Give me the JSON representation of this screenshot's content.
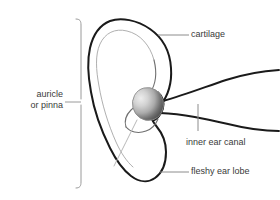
{
  "diagram": {
    "background_color": "#ffffff",
    "line_color": "#1a1a1a",
    "inner_line_color": "#a8a8a8",
    "leader_line_color": "#8c8c8c",
    "bracket_color": "#9a9a9a",
    "text_color": "#3a3a3a",
    "canal_gradient": {
      "highlight": "#e8e8e8",
      "midtone": "#b4b4b4",
      "shadow": "#4a4a4a"
    }
  },
  "labels": {
    "cartilage": "cartilage",
    "inner_ear_canal": "inner ear canal",
    "fleshy_ear_lobe": "fleshy ear lobe",
    "auricle_line1": "auricle",
    "auricle_line2": "or pinna"
  },
  "parts": {
    "helix": "helix-outer-rim",
    "antihelix": "antihelix-inner-ridge",
    "concha": "concha-bowl",
    "ear_canal": "ear-canal-opening",
    "tragus": "tragus",
    "lobe": "ear-lobe",
    "head_profile_upper": "head-profile-upper-line",
    "head_profile_lower": "head-profile-lower-line"
  }
}
